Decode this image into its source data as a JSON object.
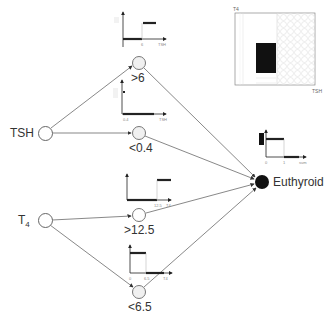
{
  "diagram": {
    "type": "fuzzy-logic network",
    "inputs": [
      {
        "id": "tsh",
        "label": "TSH"
      },
      {
        "id": "t4",
        "label": "T4",
        "label_main": "T",
        "label_sub": "4"
      }
    ],
    "rules": [
      {
        "id": "tsh_gt6",
        "label": ">6",
        "input": "TSH",
        "threshold_tick": "6",
        "axis_label": "TSH"
      },
      {
        "id": "tsh_lt04",
        "label": "<0.4",
        "input": "TSH",
        "threshold_tick": "0.4",
        "axis_label": "TSH"
      },
      {
        "id": "t4_gt125",
        "label": ">12.5",
        "input": "T4",
        "threshold_tick": "12.5",
        "axis_label": "T4"
      },
      {
        "id": "t4_lt65",
        "label": "<6.5",
        "input": "T4",
        "origin_tick": "0",
        "threshold_tick": "6.5",
        "axis_label": "T4"
      }
    ],
    "output": {
      "label": "Euthyroid",
      "plot": {
        "origin_tick": "0",
        "threshold_tick": "1",
        "axis_label": "sum"
      }
    },
    "region_plot": {
      "y_label": "T4",
      "x_label": "TSH"
    }
  }
}
